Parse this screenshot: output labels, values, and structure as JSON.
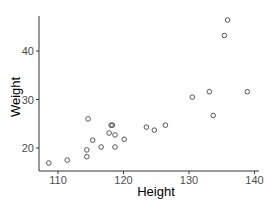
{
  "chart_data": {
    "type": "scatter",
    "title": "",
    "xlabel": "Height",
    "ylabel": "Weight",
    "xlim": [
      107.5,
      140.5
    ],
    "ylim": [
      15.5,
      48
    ],
    "xticks": [
      110,
      120,
      130,
      140
    ],
    "yticks": [
      20,
      30,
      40
    ],
    "grid": false,
    "legend": null,
    "points": [
      {
        "x": 108.6,
        "y": 16.9
      },
      {
        "x": 111.4,
        "y": 17.5
      },
      {
        "x": 114.4,
        "y": 19.6
      },
      {
        "x": 114.4,
        "y": 18.2
      },
      {
        "x": 114.6,
        "y": 26.0
      },
      {
        "x": 115.3,
        "y": 21.6
      },
      {
        "x": 116.6,
        "y": 20.2
      },
      {
        "x": 117.8,
        "y": 23.1
      },
      {
        "x": 118.1,
        "y": 24.7
      },
      {
        "x": 118.3,
        "y": 24.7
      },
      {
        "x": 118.7,
        "y": 22.7
      },
      {
        "x": 118.7,
        "y": 20.2
      },
      {
        "x": 120.1,
        "y": 21.8
      },
      {
        "x": 123.5,
        "y": 24.3
      },
      {
        "x": 124.7,
        "y": 23.7
      },
      {
        "x": 126.4,
        "y": 24.7
      },
      {
        "x": 130.5,
        "y": 30.5
      },
      {
        "x": 133.1,
        "y": 31.6
      },
      {
        "x": 133.7,
        "y": 26.7
      },
      {
        "x": 135.4,
        "y": 43.2
      },
      {
        "x": 135.9,
        "y": 46.4
      },
      {
        "x": 138.9,
        "y": 31.6
      }
    ]
  }
}
